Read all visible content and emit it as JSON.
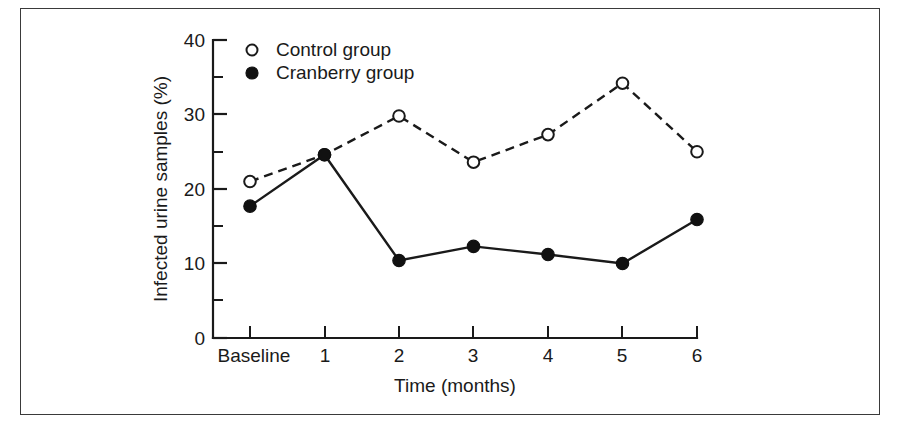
{
  "figure": {
    "border_color": "#3a3a3a",
    "background": "#ffffff"
  },
  "chart_data": {
    "type": "line",
    "title": "",
    "xlabel": "Time (months)",
    "ylabel": "Infected urine samples (%)",
    "categories": [
      "Baseline",
      "1",
      "2",
      "3",
      "4",
      "5",
      "6"
    ],
    "xlim": [
      0,
      6
    ],
    "ylim": [
      0,
      40
    ],
    "yticks": [
      0,
      10,
      20,
      30,
      40
    ],
    "ytick_labels": [
      "0",
      "10",
      "20",
      "30",
      "40"
    ],
    "yminor_ticks": [
      5,
      15,
      25,
      35
    ],
    "grid": false,
    "legend_position": "top-left-inside",
    "series": [
      {
        "name": "Control group",
        "marker": "open-circle",
        "linestyle": "dashed",
        "color": "#1a1a1a",
        "values": [
          21.0,
          24.6,
          29.8,
          23.6,
          27.3,
          34.2,
          25.0
        ]
      },
      {
        "name": "Cranberry group",
        "marker": "filled-circle",
        "linestyle": "solid",
        "color": "#111111",
        "values": [
          17.7,
          24.6,
          10.4,
          12.3,
          11.2,
          10.0,
          15.9
        ]
      }
    ]
  },
  "legend": {
    "entries": [
      {
        "label": "Control group",
        "marker": "open-circle"
      },
      {
        "label": "Cranberry group",
        "marker": "filled-circle"
      }
    ]
  },
  "axis_labels": {
    "y_title": "Infected urine samples (%)",
    "x_title": "Time (months)",
    "y_ticks": [
      "40",
      "30",
      "20",
      "10",
      "0"
    ],
    "x_ticks": [
      "Baseline",
      "1",
      "2",
      "3",
      "4",
      "5",
      "6"
    ]
  }
}
